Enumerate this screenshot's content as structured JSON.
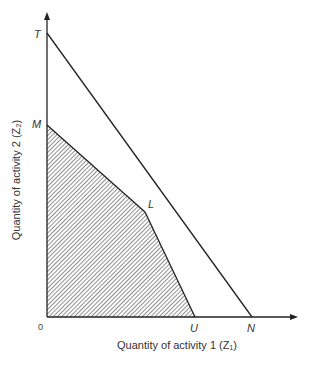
{
  "diagram": {
    "x_axis_title": "Quantity of activity 1 (Z₁)",
    "y_axis_title": "Quantity of activity 2 (Z₂)",
    "origin_label": "0",
    "points": {
      "T": "T",
      "M": "M",
      "L": "L",
      "U": "U",
      "N": "N"
    },
    "lines": [
      {
        "from": "T",
        "to": "N",
        "style": "solid"
      },
      {
        "from": "M",
        "to": "L",
        "style": "solid"
      },
      {
        "from": "L",
        "to": "U",
        "style": "solid"
      }
    ],
    "shaded_region": [
      "0",
      "M",
      "L",
      "U"
    ],
    "colors": {
      "line": "#222222",
      "hatch": "#333333",
      "background": "#ffffff"
    }
  }
}
